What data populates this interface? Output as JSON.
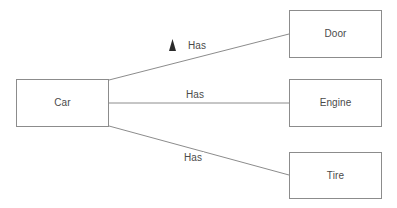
{
  "diagram": {
    "type": "entity-relationship",
    "background_color": "#ffffff",
    "stroke_color": "#8c8c8c",
    "text_color": "#4a4a4a",
    "marker_color": "#2b2b2b",
    "canvas": {
      "width": 397,
      "height": 208
    },
    "entities": [
      {
        "id": "car",
        "label": "Car",
        "x": 16,
        "y": 79,
        "width": 93,
        "height": 48
      },
      {
        "id": "door",
        "label": "Door",
        "x": 289,
        "y": 10,
        "width": 93,
        "height": 48
      },
      {
        "id": "engine",
        "label": "Engine",
        "x": 289,
        "y": 79,
        "width": 93,
        "height": 48
      },
      {
        "id": "tire",
        "label": "Tire",
        "x": 289,
        "y": 152,
        "width": 93,
        "height": 47
      }
    ],
    "relationships": [
      {
        "id": "car-has-door",
        "label": "Has",
        "from": "car",
        "to": "door",
        "from_point": {
          "x": 109,
          "y": 80
        },
        "to_point": {
          "x": 289,
          "y": 34
        },
        "marker": "solid-triangle-up",
        "has_marker": true
      },
      {
        "id": "car-has-engine",
        "label": "Has",
        "from": "car",
        "to": "engine",
        "from_point": {
          "x": 109,
          "y": 103
        },
        "to_point": {
          "x": 289,
          "y": 103
        },
        "marker": "none",
        "has_marker": false
      },
      {
        "id": "car-has-tire",
        "label": "Has",
        "from": "car",
        "to": "tire",
        "from_point": {
          "x": 109,
          "y": 126
        },
        "to_point": {
          "x": 289,
          "y": 175
        },
        "marker": "none",
        "has_marker": false
      }
    ]
  }
}
